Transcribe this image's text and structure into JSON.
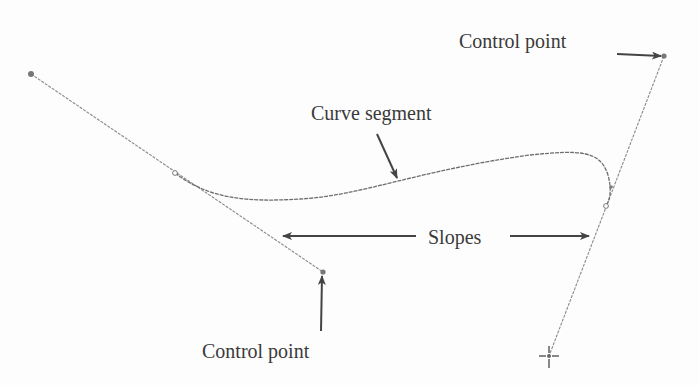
{
  "diagram": {
    "type": "bezier-curve-illustration",
    "labels": {
      "control_point_top": "Control point",
      "curve_segment": "Curve segment",
      "slopes": "Slopes",
      "control_point_bottom": "Control point"
    },
    "colors": {
      "line": "#8a8a8a",
      "curve": "#6e6e6e",
      "arrow": "#444444",
      "text": "#3a3a3a",
      "point": "#777777"
    },
    "points": {
      "left_endpoint": [
        31,
        74
      ],
      "left_control_point": [
        323,
        272
      ],
      "left_tangent_marker": [
        175,
        173
      ],
      "right_control_point": [
        664,
        56
      ],
      "right_endpoint_crosshair": [
        549,
        356
      ],
      "right_tangent_marker": [
        606,
        206
      ]
    }
  }
}
